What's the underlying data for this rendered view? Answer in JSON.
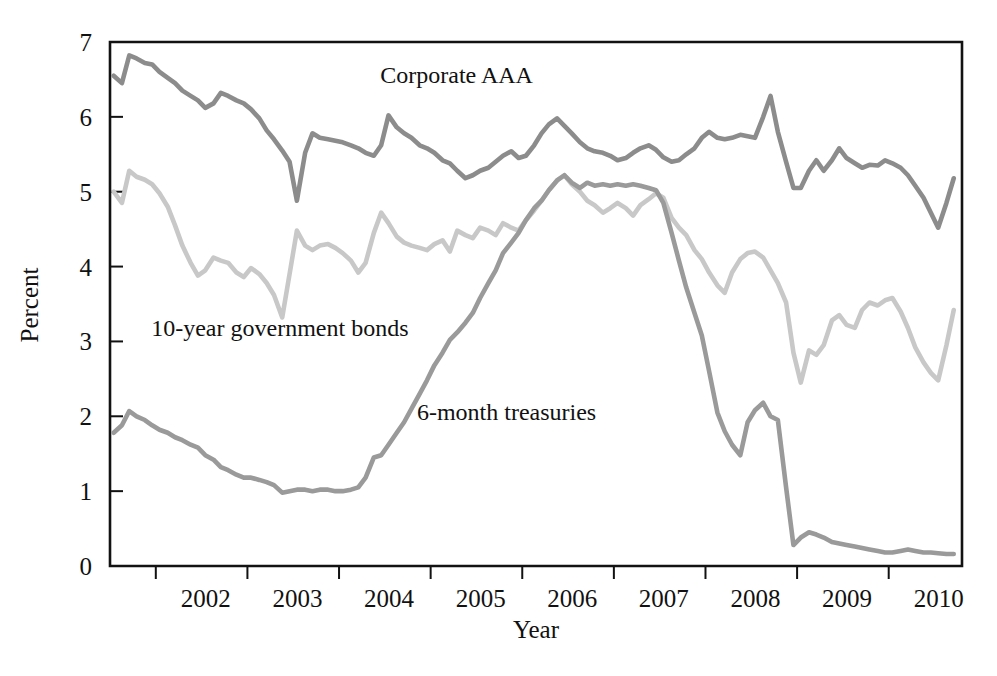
{
  "chart_data": {
    "type": "line",
    "title": "",
    "xlabel": "Year",
    "ylabel": "Percent",
    "xlim": [
      2001.5,
      2010.8
    ],
    "ylim": [
      0,
      7
    ],
    "grid": false,
    "legend_position": "inline-annotations",
    "xticks": [
      2002,
      2003,
      2004,
      2005,
      2006,
      2007,
      2008,
      2009,
      2010
    ],
    "xtick_labels": [
      "2002",
      "2003",
      "2004",
      "2005",
      "2006",
      "2007",
      "2008",
      "2009",
      "2010"
    ],
    "yticks": [
      0,
      1,
      2,
      3,
      4,
      5,
      6,
      7
    ],
    "ytick_labels": [
      "0",
      "1",
      "2",
      "3",
      "4",
      "5",
      "6",
      "7"
    ],
    "annotations": [
      {
        "text": "Corporate AAA",
        "x": 2004.45,
        "y": 6.45
      },
      {
        "text": "10-year government bonds",
        "x": 2001.95,
        "y": 3.07
      },
      {
        "text": "6-month treasuries",
        "x": 2004.85,
        "y": 1.95
      }
    ],
    "colors": {
      "corporate_aaa": "#8c8c8c",
      "ten_year_bonds": "#c8c8c8",
      "six_month_treasuries": "#9a9a9a",
      "axis": "#121212"
    },
    "x": [
      2001.54,
      2001.63,
      2001.71,
      2001.79,
      2001.88,
      2001.96,
      2002.04,
      2002.13,
      2002.21,
      2002.29,
      2002.38,
      2002.46,
      2002.54,
      2002.63,
      2002.71,
      2002.79,
      2002.88,
      2002.96,
      2003.04,
      2003.13,
      2003.21,
      2003.29,
      2003.38,
      2003.46,
      2003.54,
      2003.63,
      2003.71,
      2003.79,
      2003.88,
      2003.96,
      2004.04,
      2004.13,
      2004.21,
      2004.29,
      2004.38,
      2004.46,
      2004.54,
      2004.63,
      2004.71,
      2004.79,
      2004.88,
      2004.96,
      2005.04,
      2005.13,
      2005.21,
      2005.29,
      2005.38,
      2005.46,
      2005.54,
      2005.63,
      2005.71,
      2005.79,
      2005.88,
      2005.96,
      2006.04,
      2006.13,
      2006.21,
      2006.29,
      2006.38,
      2006.46,
      2006.54,
      2006.63,
      2006.71,
      2006.79,
      2006.88,
      2006.96,
      2007.04,
      2007.13,
      2007.21,
      2007.29,
      2007.38,
      2007.46,
      2007.54,
      2007.63,
      2007.71,
      2007.79,
      2007.88,
      2007.96,
      2008.04,
      2008.13,
      2008.21,
      2008.29,
      2008.38,
      2008.46,
      2008.54,
      2008.63,
      2008.71,
      2008.79,
      2008.88,
      2008.96,
      2009.04,
      2009.13,
      2009.21,
      2009.29,
      2009.38,
      2009.46,
      2009.54,
      2009.63,
      2009.71,
      2009.79,
      2009.88,
      2009.96,
      2010.04,
      2010.13,
      2010.21,
      2010.29,
      2010.38,
      2010.46,
      2010.54,
      2010.63,
      2010.71
    ],
    "series": [
      {
        "name": "Corporate AAA",
        "color": "#8c8c8c",
        "values": [
          6.55,
          6.45,
          6.82,
          6.78,
          6.72,
          6.7,
          6.6,
          6.52,
          6.45,
          6.35,
          6.28,
          6.22,
          6.12,
          6.18,
          6.32,
          6.28,
          6.22,
          6.18,
          6.1,
          5.98,
          5.82,
          5.7,
          5.55,
          5.4,
          4.88,
          5.52,
          5.78,
          5.72,
          5.7,
          5.68,
          5.66,
          5.62,
          5.58,
          5.52,
          5.48,
          5.62,
          6.02,
          5.86,
          5.78,
          5.72,
          5.62,
          5.58,
          5.52,
          5.42,
          5.38,
          5.28,
          5.18,
          5.22,
          5.28,
          5.32,
          5.4,
          5.48,
          5.54,
          5.45,
          5.48,
          5.62,
          5.78,
          5.9,
          5.98,
          5.88,
          5.78,
          5.66,
          5.58,
          5.54,
          5.52,
          5.48,
          5.42,
          5.45,
          5.52,
          5.58,
          5.62,
          5.56,
          5.46,
          5.4,
          5.42,
          5.5,
          5.58,
          5.72,
          5.8,
          5.72,
          5.7,
          5.72,
          5.76,
          5.74,
          5.72,
          6.0,
          6.28,
          5.8,
          5.4,
          5.05,
          5.05,
          5.28,
          5.42,
          5.28,
          5.42,
          5.58,
          5.45,
          5.38,
          5.32,
          5.36,
          5.35,
          5.42,
          5.38,
          5.32,
          5.22,
          5.08,
          4.92,
          4.72,
          4.52,
          4.85,
          5.18
        ]
      },
      {
        "name": "10-year government bonds",
        "color": "#c8c8c8",
        "values": [
          5.0,
          4.85,
          5.28,
          5.2,
          5.16,
          5.1,
          4.98,
          4.8,
          4.55,
          4.28,
          4.05,
          3.88,
          3.95,
          4.12,
          4.08,
          4.05,
          3.92,
          3.86,
          3.98,
          3.9,
          3.78,
          3.62,
          3.32,
          3.9,
          4.48,
          4.28,
          4.22,
          4.28,
          4.3,
          4.25,
          4.18,
          4.08,
          3.92,
          4.05,
          4.45,
          4.72,
          4.58,
          4.4,
          4.32,
          4.28,
          4.25,
          4.22,
          4.3,
          4.35,
          4.2,
          4.48,
          4.42,
          4.38,
          4.52,
          4.48,
          4.42,
          4.58,
          4.52,
          4.48,
          4.62,
          4.75,
          4.88,
          5.02,
          5.15,
          5.22,
          5.1,
          5.0,
          4.88,
          4.82,
          4.72,
          4.78,
          4.85,
          4.78,
          4.68,
          4.82,
          4.9,
          4.98,
          4.92,
          4.65,
          4.52,
          4.42,
          4.22,
          4.1,
          3.92,
          3.75,
          3.65,
          3.92,
          4.1,
          4.18,
          4.2,
          4.12,
          3.95,
          3.78,
          3.52,
          2.85,
          2.45,
          2.88,
          2.82,
          2.95,
          3.28,
          3.35,
          3.22,
          3.18,
          3.42,
          3.52,
          3.48,
          3.55,
          3.58,
          3.4,
          3.18,
          2.92,
          2.72,
          2.58,
          2.48,
          2.95,
          3.42
        ]
      },
      {
        "name": "6-month treasuries",
        "color": "#9a9a9a",
        "values": [
          1.78,
          1.88,
          2.07,
          2.0,
          1.95,
          1.88,
          1.82,
          1.78,
          1.72,
          1.68,
          1.62,
          1.58,
          1.48,
          1.42,
          1.32,
          1.28,
          1.22,
          1.18,
          1.18,
          1.15,
          1.12,
          1.08,
          0.98,
          1.0,
          1.02,
          1.02,
          1.0,
          1.02,
          1.02,
          1.0,
          1.0,
          1.02,
          1.05,
          1.18,
          1.45,
          1.48,
          1.62,
          1.78,
          1.92,
          2.1,
          2.3,
          2.48,
          2.68,
          2.85,
          3.02,
          3.12,
          3.25,
          3.38,
          3.58,
          3.78,
          3.95,
          4.18,
          4.32,
          4.45,
          4.62,
          4.78,
          4.88,
          5.02,
          5.15,
          5.22,
          5.12,
          5.05,
          5.12,
          5.08,
          5.1,
          5.08,
          5.1,
          5.08,
          5.1,
          5.08,
          5.05,
          5.02,
          4.85,
          4.45,
          4.08,
          3.72,
          3.38,
          3.08,
          2.6,
          2.05,
          1.8,
          1.62,
          1.48,
          1.92,
          2.08,
          2.18,
          2.0,
          1.95,
          1.05,
          0.28,
          0.38,
          0.45,
          0.42,
          0.38,
          0.32,
          0.3,
          0.28,
          0.26,
          0.24,
          0.22,
          0.2,
          0.18,
          0.18,
          0.2,
          0.22,
          0.2,
          0.18,
          0.18,
          0.17,
          0.16,
          0.16
        ]
      }
    ]
  },
  "geometry": {
    "plot_left": 110,
    "plot_right": 962,
    "plot_top": 42,
    "plot_bottom": 566
  }
}
